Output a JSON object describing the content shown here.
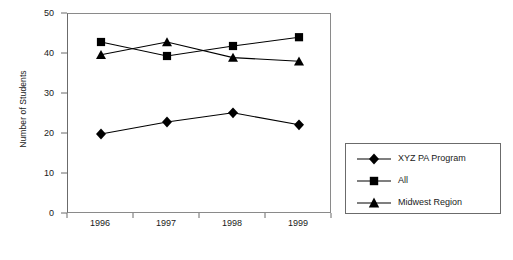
{
  "chart_data": {
    "type": "line",
    "title": "",
    "xlabel": "",
    "ylabel": "Number of Students",
    "categories": [
      "1996",
      "1997",
      "1998",
      "1999"
    ],
    "ylim": [
      0,
      50
    ],
    "ytick_labels": [
      "0",
      "10",
      "20",
      "30",
      "40",
      "50"
    ],
    "ytick_values": [
      0,
      10,
      20,
      30,
      40,
      50
    ],
    "grid": false,
    "legend_position": "right-outside",
    "series": [
      {
        "name": "XYZ PA Program",
        "marker": "diamond",
        "color": "#000000",
        "values": [
          20,
          23,
          25.3,
          22.3
        ]
      },
      {
        "name": "All",
        "marker": "square",
        "color": "#000000",
        "values": [
          43,
          39.5,
          42,
          44.2
        ]
      },
      {
        "name": "Midwest Region",
        "marker": "triangle",
        "color": "#000000",
        "values": [
          39.8,
          43,
          39.1,
          38.2
        ]
      }
    ]
  },
  "axis": {
    "y_title": "Number of Students"
  },
  "legend": {
    "entries": [
      {
        "label": "XYZ PA Program"
      },
      {
        "label": "All"
      },
      {
        "label": "Midwest Region"
      }
    ]
  }
}
